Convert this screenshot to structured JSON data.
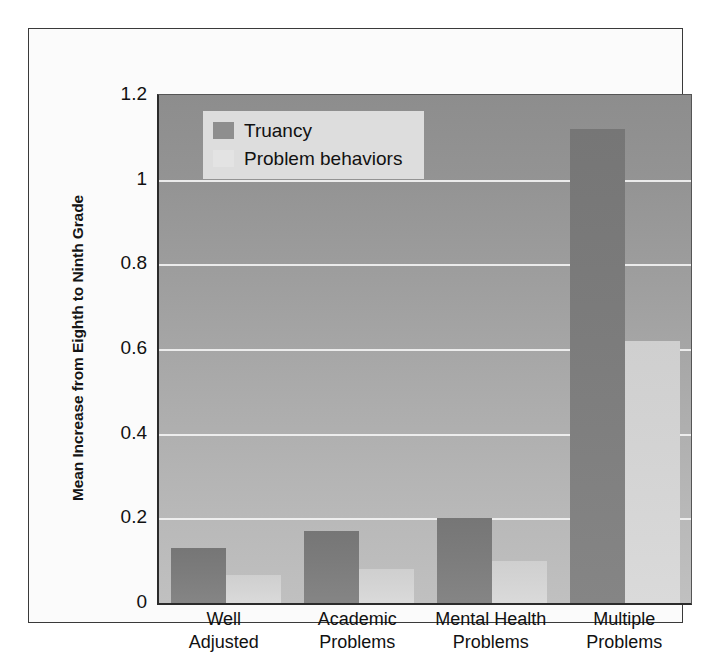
{
  "chart_data": {
    "type": "bar",
    "title": "",
    "subtitle": "",
    "xlabel": "",
    "ylabel": "Mean Increase from Eighth to Ninth Grade",
    "ylim": [
      0,
      1.2
    ],
    "yticks": [
      "0",
      "0.2",
      "0.4",
      "0.6",
      "0.8",
      "1",
      "1.2"
    ],
    "ytick_values": [
      0,
      0.2,
      0.4,
      0.6,
      0.8,
      1,
      1.2
    ],
    "gridlines": [
      0.2,
      0.4,
      0.6,
      0.8,
      1
    ],
    "grid": true,
    "legend_position": "top-left-inside",
    "categories": [
      "Well Adjusted",
      "Academic Problems",
      "Mental Health Problems",
      "Multiple Problems"
    ],
    "category_lines": [
      {
        "l1": "Well",
        "l2": "Adjusted"
      },
      {
        "l1": "Academic",
        "l2": "Problems"
      },
      {
        "l1": "Mental Health",
        "l2": "Problems"
      },
      {
        "l1": "Multiple",
        "l2": "Problems"
      }
    ],
    "series": [
      {
        "name": "Truancy",
        "color": "#7c7c7c",
        "values": [
          0.13,
          0.17,
          0.2,
          1.12
        ]
      },
      {
        "name": "Problem behaviors",
        "color": "#d4d4d4",
        "values": [
          0.065,
          0.08,
          0.1,
          0.62
        ]
      }
    ]
  },
  "legend": {
    "items": [
      {
        "label": "Truancy",
        "swatch": "truancy"
      },
      {
        "label": "Problem behaviors",
        "swatch": "problem"
      }
    ]
  },
  "colors": {
    "plot_background_top": "#8d8d8d",
    "plot_background_bottom": "#c0c0c0",
    "gridline": "#f2f2f2",
    "truancy_bar": "#7c7c7c",
    "problem_bar": "#d4d4d4",
    "legend_background": "#dddddd",
    "axis": "#2b2b2b",
    "frame": "#3a3a3a",
    "page_background": "#fbfbfb",
    "text": "#111111"
  }
}
